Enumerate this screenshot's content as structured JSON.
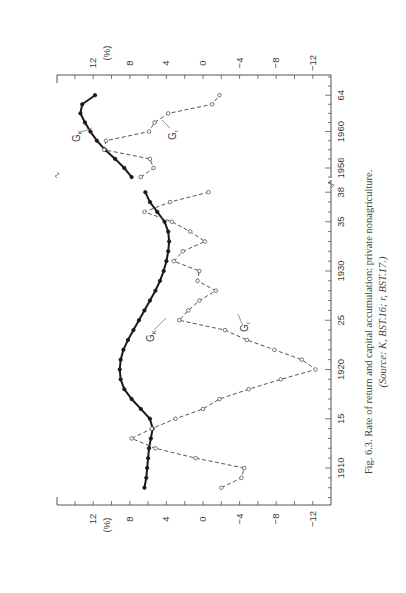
{
  "caption": {
    "line1": "Fig. 6.3.  Rate of return and capital accumulation: private nonagriculture.",
    "line2": "(Source: K, BST.16; r, BST.17.)"
  },
  "chart_data": [
    {
      "type": "line",
      "panel": "main",
      "title": "Rate of return and capital accumulation: private nonagriculture",
      "xlabel": "Year",
      "ylabel": "(%)",
      "x_tick_labels": [
        "1910",
        "15",
        "1920",
        "25",
        "1930",
        "35",
        "38"
      ],
      "x_ticks": [
        1910,
        1915,
        1920,
        1925,
        1930,
        1935,
        1938
      ],
      "y_tick_labels": [
        "12",
        "8",
        "4",
        "0",
        "−4",
        "−8",
        "−12"
      ],
      "y_ticks": [
        12,
        8,
        4,
        0,
        -4,
        -8,
        -12
      ],
      "ylim": [
        -14,
        16
      ],
      "xlim": [
        1907,
        1939
      ],
      "grid": false,
      "series": [
        {
          "name": "G_K",
          "style": "solid",
          "marker": "filled-circle",
          "x": [
            1908,
            1909,
            1910,
            1911,
            1912,
            1913,
            1914,
            1915,
            1916,
            1917,
            1918,
            1919,
            1920,
            1921,
            1922,
            1923,
            1924,
            1925,
            1926,
            1927,
            1928,
            1929,
            1930,
            1931,
            1932,
            1933,
            1934,
            1935,
            1936,
            1937,
            1938
          ],
          "values": [
            6.4,
            6.2,
            6.1,
            6.0,
            5.9,
            5.7,
            5.5,
            5.8,
            6.8,
            7.8,
            8.6,
            9.0,
            9.1,
            9.0,
            8.7,
            8.2,
            7.6,
            7.0,
            6.4,
            5.8,
            5.2,
            4.7,
            4.3,
            4.0,
            3.8,
            3.7,
            3.8,
            4.2,
            5.0,
            5.8,
            6.3
          ]
        },
        {
          "name": "G_r",
          "style": "dashed",
          "marker": "open-circle",
          "x": [
            1908,
            1909,
            1910,
            1911,
            1912,
            1913,
            1914,
            1915,
            1916,
            1917,
            1918,
            1919,
            1920,
            1921,
            1922,
            1923,
            1924,
            1925,
            1926,
            1927,
            1928,
            1929,
            1930,
            1931,
            1932,
            1933,
            1934,
            1935,
            1936,
            1937,
            1938
          ],
          "values": [
            -2.0,
            -4.2,
            -4.5,
            0.8,
            5.2,
            7.8,
            5.6,
            3.0,
            0.0,
            -1.8,
            -5.0,
            -8.5,
            -12.3,
            -10.8,
            -7.8,
            -4.8,
            -2.4,
            2.6,
            1.6,
            0.4,
            -1.4,
            0.6,
            0.4,
            3.2,
            2.2,
            -0.2,
            1.4,
            3.4,
            6.4,
            3.6,
            -0.6
          ]
        }
      ],
      "annotations": [
        {
          "text": "G_K",
          "near": "1926"
        },
        {
          "text": "G_r",
          "near": "1926"
        }
      ]
    },
    {
      "type": "line",
      "panel": "postwar",
      "xlabel": "Year",
      "ylabel": "(%)",
      "x_tick_labels": [
        "1956",
        "1960",
        "64"
      ],
      "x_ticks": [
        1956,
        1960,
        1964
      ],
      "y_tick_labels": [
        "12",
        "8",
        "4",
        "0",
        "−4",
        "−8",
        "−12"
      ],
      "y_ticks": [
        12,
        8,
        4,
        0,
        -4,
        -8,
        -12
      ],
      "ylim": [
        -14,
        16
      ],
      "xlim": [
        1954,
        1966
      ],
      "grid": false,
      "series": [
        {
          "name": "G_K",
          "style": "solid",
          "marker": "filled-circle",
          "x": [
            1955,
            1956,
            1957,
            1958,
            1959,
            1960,
            1961,
            1962,
            1963,
            1964
          ],
          "values": [
            7.8,
            8.6,
            9.6,
            10.7,
            11.6,
            12.3,
            12.9,
            13.4,
            13.2,
            11.8
          ]
        },
        {
          "name": "G_r",
          "style": "dashed",
          "marker": "open-circle",
          "x": [
            1955,
            1956,
            1957,
            1958,
            1959,
            1960,
            1961,
            1962,
            1963,
            1964
          ],
          "values": [
            6.8,
            5.4,
            5.8,
            10.8,
            10.6,
            5.9,
            5.3,
            3.8,
            -1.0,
            -1.8
          ]
        }
      ],
      "annotations": [
        {
          "text": "G_K",
          "near": "1960"
        },
        {
          "text": "G_r",
          "near": "1960"
        }
      ]
    }
  ]
}
